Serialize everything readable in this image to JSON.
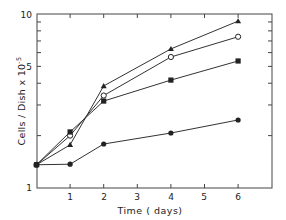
{
  "chart_data": {
    "type": "line",
    "title": "",
    "xlabel": "Time ( days)",
    "ylabel": "Cells / Dish x 10⁻⁵",
    "yscale": "log",
    "xlim": [
      0,
      7
    ],
    "ylim": [
      1,
      10
    ],
    "x_ticks": [
      "1",
      "2",
      "3",
      "4",
      "5",
      "6"
    ],
    "y_tick_labels": [
      "1",
      "5",
      "10"
    ],
    "grid": false,
    "legend": "none",
    "x": [
      0,
      1,
      2,
      4,
      6
    ],
    "series": [
      {
        "name": "filled-triangle",
        "marker": "triangle-filled",
        "values": [
          1.36,
          1.77,
          3.86,
          6.3,
          9.1
        ]
      },
      {
        "name": "open-circle",
        "marker": "circle-open",
        "values": [
          1.36,
          2.0,
          3.4,
          5.66,
          7.4
        ]
      },
      {
        "name": "filled-square",
        "marker": "square-filled",
        "values": [
          1.36,
          2.1,
          3.16,
          4.17,
          5.37
        ]
      },
      {
        "name": "filled-circle",
        "marker": "circle-filled",
        "values": [
          1.36,
          1.37,
          1.79,
          2.07,
          2.46
        ]
      }
    ]
  },
  "labels": {
    "y1": "1",
    "y5": "5",
    "y10": "10",
    "x1": "1",
    "x2": "2",
    "x3": "3",
    "x4": "4",
    "x5": "5",
    "x6": "6",
    "xlabel": "Time ( days)",
    "ylabel": "Cells / Dish  x 10",
    "ylabel_exp": "-5"
  }
}
